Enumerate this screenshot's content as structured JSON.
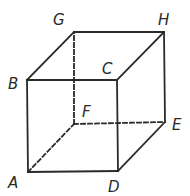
{
  "diagram": {
    "type": "cube",
    "colors": {
      "stroke": "#2a2a2a",
      "background": "#ffffff"
    },
    "vertices": {
      "A": {
        "label": "A",
        "x": 28,
        "y": 172,
        "lx": 8,
        "ly": 176
      },
      "B": {
        "label": "B",
        "x": 27,
        "y": 80,
        "lx": 8,
        "ly": 77
      },
      "C": {
        "label": "C",
        "x": 117,
        "y": 80,
        "lx": 102,
        "ly": 62
      },
      "D": {
        "label": "D",
        "x": 118,
        "y": 171,
        "lx": 108,
        "ly": 180
      },
      "E": {
        "label": "E",
        "x": 165,
        "y": 122,
        "lx": 172,
        "ly": 118
      },
      "F": {
        "label": "F",
        "x": 74,
        "y": 124,
        "lx": 82,
        "ly": 105
      },
      "G": {
        "label": "G",
        "x": 74,
        "y": 32,
        "lx": 53,
        "ly": 13
      },
      "H": {
        "label": "H",
        "x": 164,
        "y": 32,
        "lx": 158,
        "ly": 13
      }
    },
    "solid_edges": [
      [
        "A",
        "B"
      ],
      [
        "B",
        "C"
      ],
      [
        "C",
        "D"
      ],
      [
        "D",
        "A"
      ],
      [
        "B",
        "G"
      ],
      [
        "G",
        "H"
      ],
      [
        "H",
        "C"
      ],
      [
        "H",
        "E"
      ],
      [
        "E",
        "D"
      ]
    ],
    "hidden_edges": [
      [
        "A",
        "F"
      ],
      [
        "F",
        "G"
      ],
      [
        "F",
        "E"
      ]
    ]
  }
}
